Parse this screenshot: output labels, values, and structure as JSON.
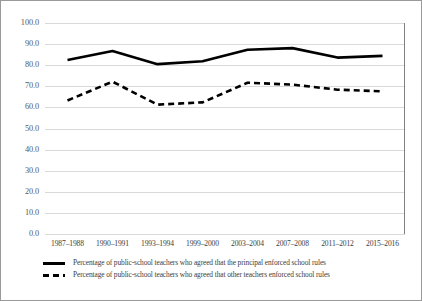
{
  "chart_data": {
    "type": "line",
    "title": "",
    "xlabel": "",
    "ylabel": "",
    "ylim": [
      0.0,
      100.0
    ],
    "ytick_step": 10.0,
    "grid": true,
    "legend_position": "bottom-left",
    "categories": [
      "1987–1988",
      "1990–1991",
      "1993–1994",
      "1999–2000",
      "2003–2004",
      "2007–2008",
      "2011–2012",
      "2015–2016"
    ],
    "ytick_labels": [
      "100.0",
      "90.0",
      "80.0",
      "70.0",
      "60.0",
      "50.0",
      "40.0",
      "30.0",
      "20.0",
      "10.0",
      "0.0"
    ],
    "ytick_values": [
      100.0,
      90.0,
      80.0,
      70.0,
      60.0,
      50.0,
      40.0,
      30.0,
      20.0,
      10.0,
      0.0
    ],
    "series": [
      {
        "name": "Percentage of public-school teachers who agreed that the principal enforced school rules",
        "style": "solid",
        "color": "#000000",
        "values": [
          82.5,
          86.7,
          80.5,
          81.9,
          87.3,
          88.1,
          83.6,
          84.4
        ]
      },
      {
        "name": "Percentage of public-school teachers who agreed that other teachers enforced school rules",
        "style": "dashed",
        "color": "#000000",
        "values": [
          63.3,
          72.2,
          61.3,
          62.4,
          71.7,
          70.8,
          68.4,
          67.6
        ]
      }
    ]
  },
  "legend": {
    "items": [
      {
        "marker": "solid-line-marker",
        "label": "Percentage of public-school teachers who agreed that the principal enforced school rules"
      },
      {
        "marker": "dashed-line-marker",
        "label": "Percentage of public-school teachers who agreed that other teachers enforced school rules"
      }
    ]
  },
  "colors": {
    "series": "#000000",
    "gridline": "#d9d9d9",
    "axis": "#808080",
    "frame": "#9a9a9a",
    "text": "#3d3d3d",
    "tick_text": "#585858",
    "background": "#ffffff"
  }
}
